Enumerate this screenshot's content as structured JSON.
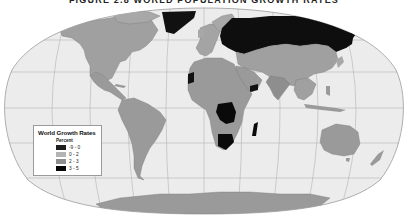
{
  "title": "FIGURE 2.8 WORLD POPULATION GROWTH RATES",
  "legend": {
    "title": "World Growth Rates",
    "subtitle": "Percent",
    "items": [
      {
        "label": "-9 - 0",
        "color": "#1e1e1e"
      },
      {
        "label": "0 - 2",
        "color": "#b4b4b4"
      },
      {
        "label": "2 - 3",
        "color": "#8e8e8e"
      },
      {
        "label": "3 - 5",
        "color": "#050505"
      }
    ]
  },
  "colors": {
    "ocean": "#ececec",
    "graticule": "#a8a8a8",
    "outline": "#9c9c9c",
    "land_default": "#a0a0a0",
    "land_medium": "#8a8a8a",
    "land_dark": "#111111",
    "antarctica": "#9a9a9a"
  }
}
